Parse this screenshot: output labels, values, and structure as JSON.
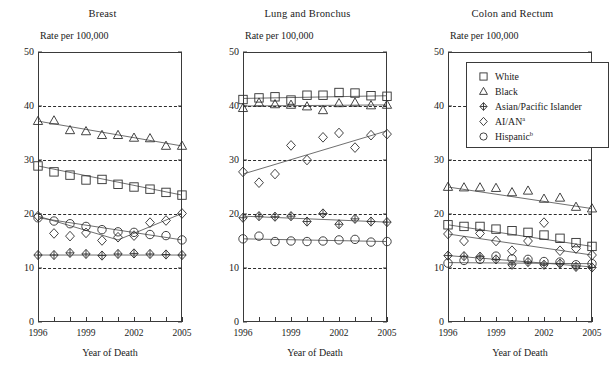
{
  "figure": {
    "ylabel": "Rate per 100,000",
    "xlabel": "Year of Death",
    "y_ticks": [
      0,
      10,
      20,
      30,
      40,
      50
    ],
    "gridlines": [
      10,
      20,
      30,
      40
    ],
    "x_ticks_labeled": [
      "1996",
      "1999",
      "2002",
      "2005"
    ],
    "ylim": [
      0,
      50
    ],
    "xlim": [
      1996,
      2005
    ]
  },
  "legend": {
    "entries": [
      {
        "label": "White",
        "marker": "square"
      },
      {
        "label": "Black",
        "marker": "triangle"
      },
      {
        "label": "Asian/Pacific Islander",
        "marker": "cross-diamond"
      },
      {
        "label": "AI/AN",
        "sup": "a",
        "marker": "diamond"
      },
      {
        "label": "Hispanic",
        "sup": "b",
        "marker": "circle"
      }
    ]
  },
  "chart_data": [
    {
      "type": "scatter",
      "title": "Breast",
      "xlabel": "Year of Death",
      "ylabel": "Rate per 100,000",
      "xlim": [
        1996,
        2005
      ],
      "ylim": [
        0,
        50
      ],
      "grid": true,
      "legend_position": "panel-3-top",
      "x": [
        1996,
        1997,
        1998,
        1999,
        2000,
        2001,
        2002,
        2003,
        2004,
        2005
      ],
      "series": [
        {
          "name": "White",
          "marker": "square",
          "values": [
            28.9,
            27.8,
            27.2,
            26.3,
            26.4,
            25.5,
            25.0,
            24.6,
            24.0,
            23.5
          ]
        },
        {
          "name": "Black",
          "marker": "triangle",
          "values": [
            37.2,
            37.3,
            35.5,
            35.3,
            34.6,
            34.6,
            34.1,
            34.0,
            32.6,
            32.6
          ]
        },
        {
          "name": "Asian/Pacific Islander",
          "marker": "cross-diamond",
          "values": [
            12.4,
            12.4,
            12.8,
            12.6,
            12.3,
            12.6,
            12.7,
            12.6,
            12.5,
            12.4
          ]
        },
        {
          "name": "AI/AN",
          "marker": "diamond",
          "values": [
            19.6,
            16.4,
            15.9,
            16.5,
            15.1,
            15.7,
            16.0,
            18.4,
            18.8,
            20.1
          ]
        },
        {
          "name": "Hispanic",
          "marker": "circle",
          "values": [
            19.3,
            18.7,
            18.2,
            17.7,
            17.1,
            16.7,
            16.6,
            16.2,
            16.0,
            15.2
          ]
        }
      ],
      "trendlines": [
        {
          "name": "White",
          "from": [
            1996,
            28.9
          ],
          "to": [
            2005,
            23.5
          ]
        },
        {
          "name": "Black",
          "from": [
            1996,
            37.2
          ],
          "to": [
            2005,
            32.6
          ]
        },
        {
          "name": "Asian/Pacific Islander",
          "from": [
            1996,
            12.4
          ],
          "to": [
            2005,
            12.4
          ]
        },
        {
          "name": "AI/AN",
          "from": [
            1996,
            19.6
          ],
          "to": [
            2001,
            15.2
          ],
          "to2": [
            2005,
            20.1
          ]
        },
        {
          "name": "Hispanic",
          "from": [
            1996,
            19.3
          ],
          "to": [
            2005,
            15.2
          ]
        }
      ]
    },
    {
      "type": "scatter",
      "title": "Lung and Bronchus",
      "xlabel": "Year of Death",
      "ylabel": "Rate per 100,000",
      "xlim": [
        1996,
        2005
      ],
      "ylim": [
        0,
        50
      ],
      "grid": true,
      "x": [
        1996,
        1997,
        1998,
        1999,
        2000,
        2001,
        2002,
        2003,
        2004,
        2005
      ],
      "series": [
        {
          "name": "White",
          "marker": "square",
          "values": [
            41.2,
            41.5,
            41.7,
            41.1,
            42.0,
            42.0,
            42.5,
            42.4,
            41.9,
            41.8
          ]
        },
        {
          "name": "Black",
          "marker": "triangle",
          "values": [
            39.6,
            40.6,
            40.3,
            40.2,
            39.9,
            39.2,
            40.5,
            40.6,
            40.1,
            40.2
          ]
        },
        {
          "name": "Asian/Pacific Islander",
          "marker": "cross-diamond",
          "values": [
            19.3,
            19.6,
            19.5,
            19.6,
            18.6,
            20.1,
            18.1,
            19.1,
            18.6,
            18.5
          ]
        },
        {
          "name": "AI/AN",
          "marker": "diamond",
          "values": [
            27.8,
            25.8,
            27.4,
            32.7,
            30.0,
            34.2,
            35.0,
            32.3,
            34.6,
            34.8
          ]
        },
        {
          "name": "Hispanic",
          "marker": "circle",
          "values": [
            15.4,
            15.9,
            14.9,
            15.0,
            14.9,
            15.0,
            15.2,
            15.3,
            14.8,
            14.9
          ]
        }
      ],
      "trendlines": [
        {
          "name": "White",
          "from": [
            1996,
            41.4
          ],
          "to": [
            2005,
            41.9
          ]
        },
        {
          "name": "Black",
          "from": [
            1996,
            40.0
          ],
          "to": [
            2005,
            40.2
          ]
        },
        {
          "name": "Asian/Pacific Islander",
          "from": [
            1996,
            19.6
          ],
          "to": [
            2005,
            18.5
          ]
        },
        {
          "name": "AI/AN",
          "from": [
            1996,
            27.4
          ],
          "to": [
            2005,
            35.4
          ]
        },
        {
          "name": "Hispanic",
          "from": [
            1996,
            15.4
          ],
          "to": [
            2005,
            14.9
          ]
        }
      ]
    },
    {
      "type": "scatter",
      "title": "Colon and Rectum",
      "xlabel": "Year of Death",
      "ylabel": "Rate per 100,000",
      "xlim": [
        1996,
        2005
      ],
      "ylim": [
        0,
        50
      ],
      "grid": true,
      "x": [
        1996,
        1997,
        1998,
        1999,
        2000,
        2001,
        2002,
        2003,
        2004,
        2005
      ],
      "series": [
        {
          "name": "White",
          "marker": "square",
          "values": [
            18.0,
            17.7,
            17.7,
            17.2,
            16.9,
            16.6,
            16.1,
            15.5,
            14.7,
            14.0
          ]
        },
        {
          "name": "Black",
          "marker": "triangle",
          "values": [
            25.0,
            24.9,
            24.9,
            24.8,
            24.0,
            24.3,
            22.8,
            23.0,
            21.3,
            21.0
          ]
        },
        {
          "name": "Asian/Pacific Islander",
          "marker": "cross-diamond",
          "values": [
            12.3,
            12.2,
            12.1,
            11.6,
            10.6,
            11.1,
            10.6,
            10.8,
            10.2,
            10.1
          ]
        },
        {
          "name": "AI/AN",
          "marker": "diamond",
          "values": [
            16.3,
            15.0,
            16.4,
            15.0,
            13.2,
            15.0,
            18.4,
            13.2,
            13.6,
            12.4
          ]
        },
        {
          "name": "Hispanic",
          "marker": "circle",
          "values": [
            10.9,
            11.4,
            11.6,
            12.2,
            11.7,
            11.6,
            11.2,
            11.1,
            10.6,
            10.8
          ]
        }
      ],
      "trendlines": [
        {
          "name": "White",
          "from": [
            1996,
            18.0
          ],
          "to": [
            2005,
            14.0
          ]
        },
        {
          "name": "Black",
          "from": [
            1996,
            25.0
          ],
          "to": [
            2005,
            21.0
          ]
        },
        {
          "name": "Asian/Pacific Islander",
          "from": [
            1996,
            12.3
          ],
          "to": [
            2005,
            10.2
          ]
        },
        {
          "name": "AI/AN",
          "from": [
            1996,
            16.3
          ],
          "to": [
            2005,
            12.4
          ]
        },
        {
          "name": "Hispanic",
          "from": [
            1996,
            11.0
          ],
          "to": [
            2005,
            10.8
          ]
        }
      ]
    }
  ]
}
